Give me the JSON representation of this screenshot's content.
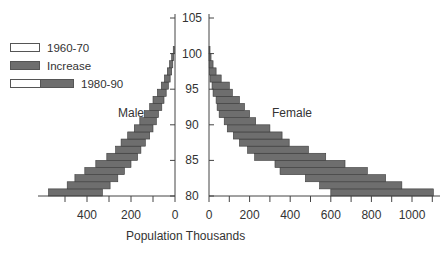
{
  "chart_data": {
    "type": "bar",
    "subtype": "population pyramid (floating horizontal bars)",
    "title": "",
    "xlabel": "Population Thousands",
    "ylabel": "",
    "yaxis": {
      "label": "Age",
      "range": [
        80,
        105
      ],
      "ticks": [
        80,
        85,
        90,
        95,
        100,
        105
      ]
    },
    "male_axis": {
      "ticks": [
        400,
        200,
        0
      ],
      "range": [
        0,
        580
      ]
    },
    "female_axis": {
      "ticks": [
        0,
        200,
        400,
        600,
        800,
        1000
      ],
      "range": [
        0,
        1110
      ]
    },
    "panels": [
      {
        "name": "Male",
        "labelText": "Male"
      },
      {
        "name": "Female",
        "labelText": "Female"
      }
    ],
    "legend": [
      {
        "label": "1960-70",
        "swatch": "white"
      },
      {
        "label": "Increase",
        "swatch": "grey"
      },
      {
        "label": "1980-90",
        "swatch": "white+grey"
      }
    ],
    "ages": [
      80,
      81,
      82,
      83,
      84,
      85,
      86,
      87,
      88,
      89,
      90,
      91,
      92,
      93,
      94,
      95,
      96,
      97,
      98,
      99,
      100
    ],
    "series": [
      {
        "name": "Male 1960-70 (bar start)",
        "values": [
          330,
          295,
          260,
          230,
          200,
          170,
          155,
          135,
          115,
          100,
          85,
          75,
          60,
          50,
          40,
          30,
          22,
          15,
          10,
          6,
          3
        ]
      },
      {
        "name": "Male 1980-90 (bar end)",
        "values": [
          575,
          490,
          455,
          410,
          360,
          310,
          270,
          245,
          215,
          185,
          160,
          140,
          115,
          100,
          80,
          62,
          48,
          35,
          25,
          15,
          8
        ]
      },
      {
        "name": "Female 1960-70 (bar start)",
        "values": [
          600,
          545,
          475,
          350,
          325,
          225,
          190,
          150,
          120,
          90,
          75,
          50,
          40,
          35,
          20,
          15,
          5,
          2,
          1,
          0,
          0
        ]
      },
      {
        "name": "Female 1980-90 (bar end)",
        "values": [
          1105,
          950,
          870,
          780,
          670,
          575,
          490,
          395,
          360,
          300,
          230,
          200,
          175,
          150,
          115,
          100,
          60,
          35,
          20,
          10,
          5
        ]
      }
    ],
    "colors": {
      "bar_fill": "#6e6e6e",
      "bar_stroke": "#3a3a3a",
      "axis": "#444444"
    }
  }
}
